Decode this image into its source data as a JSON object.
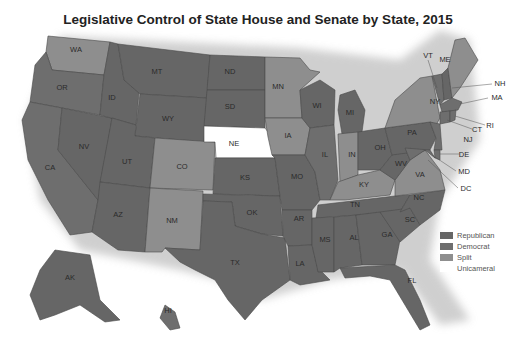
{
  "title": "Legislative Control of State House and Senate by State, 2015",
  "colors": {
    "Republican": "#666666",
    "Democrat": "#6e6e6e",
    "Split": "#8e8e8e",
    "Unicameral": "#ffffff"
  },
  "legend": [
    {
      "label": "Republican",
      "color": "#666666"
    },
    {
      "label": "Democrat",
      "color": "#6e6e6e"
    },
    {
      "label": "Split",
      "color": "#8e8e8e"
    },
    {
      "label": "Unicameral",
      "color": "#ffffff"
    }
  ],
  "states": {
    "WA": "Split",
    "OR": "Democrat",
    "CA": "Democrat",
    "NV": "Republican",
    "ID": "Republican",
    "MT": "Republican",
    "WY": "Republican",
    "UT": "Republican",
    "AZ": "Republican",
    "CO": "Split",
    "NM": "Split",
    "ND": "Republican",
    "SD": "Republican",
    "NE": "Unicameral",
    "KS": "Republican",
    "OK": "Republican",
    "TX": "Republican",
    "MN": "Split",
    "IA": "Split",
    "MO": "Republican",
    "AR": "Republican",
    "LA": "Republican",
    "WI": "Republican",
    "IL": "Democrat",
    "MI": "Republican",
    "IN": "Split",
    "OH": "Republican",
    "KY": "Split",
    "TN": "Republican",
    "MS": "Republican",
    "AL": "Republican",
    "GA": "Republican",
    "FL": "Republican",
    "SC": "Republican",
    "NC": "Republican",
    "VA": "Split",
    "WV": "Republican",
    "PA": "Republican",
    "NY": "Split",
    "ME": "Split",
    "VT": "Democrat",
    "NH": "Republican",
    "MA": "Democrat",
    "RI": "Democrat",
    "CT": "Democrat",
    "NJ": "Democrat",
    "DE": "Democrat",
    "MD": "Democrat",
    "DC": "Democrat",
    "AK": "Republican",
    "HI": "Democrat"
  },
  "labels": {
    "WA": "WA",
    "OR": "OR",
    "CA": "CA",
    "NV": "NV",
    "ID": "ID",
    "MT": "MT",
    "WY": "WY",
    "UT": "UT",
    "AZ": "AZ",
    "CO": "CO",
    "NM": "NM",
    "ND": "ND",
    "SD": "SD",
    "NE": "NE",
    "KS": "KS",
    "OK": "OK",
    "TX": "TX",
    "MN": "MN",
    "IA": "IA",
    "MO": "MO",
    "AR": "AR",
    "LA": "LA",
    "WI": "WI",
    "IL": "IL",
    "MI": "MI",
    "IN": "IN",
    "OH": "OH",
    "KY": "KY",
    "TN": "TN",
    "MS": "MS",
    "AL": "AL",
    "GA": "GA",
    "FL": "FL",
    "SC": "SC",
    "NC": "NC",
    "VA": "VA",
    "WV": "WV",
    "PA": "PA",
    "NY": "NY",
    "ME": "ME",
    "VT": "VT",
    "NH": "NH",
    "MA": "MA",
    "RI": "RI",
    "CT": "CT",
    "NJ": "NJ",
    "DE": "DE",
    "MD": "MD",
    "DC": "DC",
    "AK": "AK",
    "HI": "HI"
  }
}
